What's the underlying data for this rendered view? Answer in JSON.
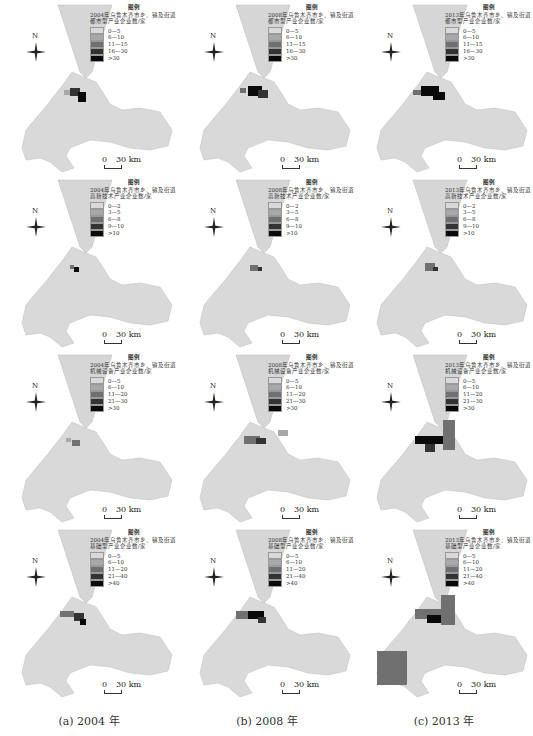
{
  "figure": {
    "columns": [
      {
        "caption": "(a) 2004 年",
        "year": "2004"
      },
      {
        "caption": "(b) 2008 年",
        "year": "2008"
      },
      {
        "caption": "(c) 2013 年",
        "year": "2013"
      }
    ],
    "north_label": "N",
    "scale_bar": {
      "zero": "0",
      "distance": "30 km"
    },
    "legend_title": "图例",
    "rows": [
      {
        "industry": "都市型产业",
        "descriptions": [
          "2004年乌鲁木齐市乡、镇及街道都市型产业企业数/家",
          "2008年乌鲁木齐市乡、镇及街道都市型产业企业数/家",
          "2013年乌鲁木齐市乡、镇及街道都市型产业企业数/家"
        ],
        "classes": [
          "0—5",
          "6—10",
          "11—15",
          "16—30",
          ">30"
        ]
      },
      {
        "industry": "高新技术产业",
        "descriptions": [
          "2004年乌鲁木齐市乡、镇及街道高新技术产业企业数/家",
          "2008年乌鲁木齐市乡、镇及街道高新技术产业企业数/家",
          "2013年乌鲁木齐市乡、镇及街道高新技术产业企业数/家"
        ],
        "classes": [
          "0—2",
          "3—5",
          "6—8",
          "9—10",
          ">10"
        ]
      },
      {
        "industry": "机械设备产业",
        "descriptions": [
          "2004年乌鲁木齐市乡、镇及街道机械设备产业企业数/家",
          "2008年乌鲁木齐市乡、镇及街道机械设备产业企业数/家",
          "2013年乌鲁木齐市乡、镇及街道机械设备产业企业数/家"
        ],
        "classes": [
          "0—5",
          "6—10",
          "11—20",
          "21—30",
          ">30"
        ]
      },
      {
        "industry": "基础型产业",
        "descriptions": [
          "2004年乌鲁木齐市乡、镇及街道基础型产业企业数/家",
          "2008年乌鲁木齐市乡、镇及街道基础型产业企业数/家",
          "2013年乌鲁木齐市乡、镇及街道基础型产业企业数/家"
        ],
        "classes": [
          "0—5",
          "6—10",
          "11—20",
          "21—40",
          ">40"
        ]
      }
    ],
    "class_colors": [
      "#d9d9d9",
      "#a8a8a8",
      "#707070",
      "#333333",
      "#0a0a0a"
    ]
  }
}
